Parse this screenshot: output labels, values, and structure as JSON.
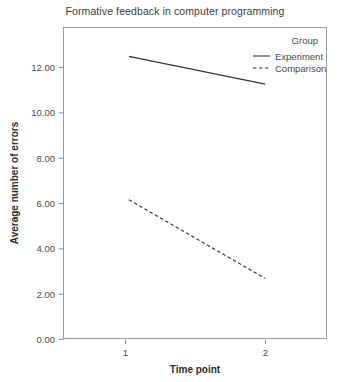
{
  "chart_data": {
    "type": "line",
    "title": "Formative feedback in computer programming",
    "xlabel": "Time point",
    "ylabel": "Average number of errors",
    "categories": [
      "1",
      "2"
    ],
    "x": [
      1,
      2
    ],
    "xlim": [
      0.52,
      2.45
    ],
    "ylim": [
      0.0,
      13.45
    ],
    "yticks": [
      "0.00",
      "2.00",
      "4.00",
      "6.00",
      "8.00",
      "10.00",
      "12.00"
    ],
    "ytick_values": [
      0,
      2,
      4,
      6,
      8,
      10,
      12
    ],
    "xticks": [
      "1",
      "2"
    ],
    "grid": false,
    "legend_position": "top-right-inside",
    "legend_title": "Group",
    "series": [
      {
        "name": "Experiment",
        "style": "solid",
        "color": "#333333",
        "values": [
          12.2,
          11.0
        ]
      },
      {
        "name": "Comparison",
        "style": "dashed",
        "color": "#333333",
        "values": [
          6.0,
          2.6
        ]
      }
    ]
  },
  "legend": {
    "title": "Group",
    "items": [
      {
        "label": "Experiment",
        "style": "solid"
      },
      {
        "label": "Comparison",
        "style": "dashed"
      }
    ]
  },
  "axes": {
    "y_title": "Average number of errors",
    "x_title": "Time point",
    "y_ticks": [
      "12.00",
      "10.00",
      "8.00",
      "6.00",
      "4.00",
      "2.00",
      "0.00"
    ],
    "x_ticks": [
      "1",
      "2"
    ]
  },
  "header": {
    "title": "Formative feedback in computer programming"
  }
}
